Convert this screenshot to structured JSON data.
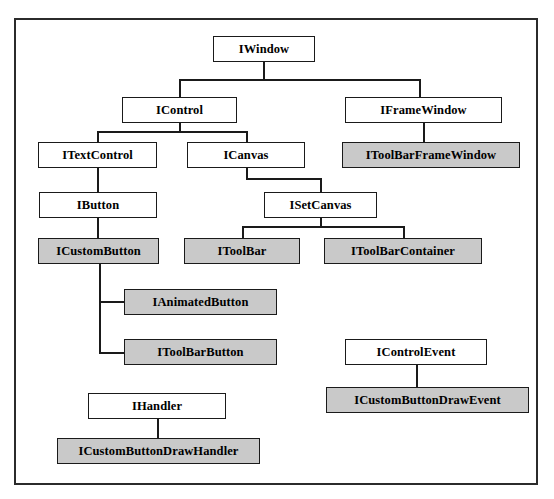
{
  "diagram": {
    "type": "class-hierarchy-tree",
    "background_color": "#ffffff",
    "frame_border_color": "#2b2b2b",
    "node_border_color": "#1a1a1a",
    "node_fill_plain": "#ffffff",
    "node_fill_shaded": "#c9c9c9",
    "nodes": [
      {
        "id": "iwindow",
        "label": "IWindow",
        "shaded": false,
        "x": 211,
        "y": 34,
        "w": 102,
        "h": 26
      },
      {
        "id": "icontrol",
        "label": "IControl",
        "shaded": false,
        "x": 120,
        "y": 95,
        "w": 115,
        "h": 26
      },
      {
        "id": "iframewindow",
        "label": "IFrameWindow",
        "shaded": false,
        "x": 343,
        "y": 95,
        "w": 157,
        "h": 26
      },
      {
        "id": "itextcontrol",
        "label": "ITextControl",
        "shaded": false,
        "x": 36,
        "y": 140,
        "w": 119,
        "h": 26
      },
      {
        "id": "icanvas",
        "label": "ICanvas",
        "shaded": false,
        "x": 185,
        "y": 140,
        "w": 118,
        "h": 26
      },
      {
        "id": "itoolbarframewindow",
        "label": "IToolBarFrameWindow",
        "shaded": true,
        "x": 340,
        "y": 140,
        "w": 178,
        "h": 26
      },
      {
        "id": "ibutton",
        "label": "IButton",
        "shaded": false,
        "x": 37,
        "y": 190,
        "w": 118,
        "h": 26
      },
      {
        "id": "isetcanvas",
        "label": "ISetCanvas",
        "shaded": false,
        "x": 262,
        "y": 190,
        "w": 113,
        "h": 26
      },
      {
        "id": "icustombutton",
        "label": "ICustomButton",
        "shaded": true,
        "x": 36,
        "y": 236,
        "w": 121,
        "h": 26
      },
      {
        "id": "itoolbar",
        "label": "IToolBar",
        "shaded": true,
        "x": 182,
        "y": 236,
        "w": 116,
        "h": 26
      },
      {
        "id": "itoolbarcontainer",
        "label": "IToolBarContainer",
        "shaded": true,
        "x": 322,
        "y": 236,
        "w": 158,
        "h": 26
      },
      {
        "id": "ianimatedbutton",
        "label": "IAnimatedButton",
        "shaded": true,
        "x": 122,
        "y": 287,
        "w": 153,
        "h": 26
      },
      {
        "id": "itoolbarbutton",
        "label": "IToolBarButton",
        "shaded": true,
        "x": 122,
        "y": 337,
        "w": 153,
        "h": 26
      },
      {
        "id": "icontrolevent",
        "label": "IControlEvent",
        "shaded": false,
        "x": 343,
        "y": 337,
        "w": 142,
        "h": 26
      },
      {
        "id": "icustombuttondrawevent",
        "label": "ICustomButtonDrawEvent",
        "shaded": true,
        "x": 324,
        "y": 385,
        "w": 203,
        "h": 26
      },
      {
        "id": "ihandler",
        "label": "IHandler",
        "shaded": false,
        "x": 86,
        "y": 391,
        "w": 138,
        "h": 26
      },
      {
        "id": "icustombuttondrawhandler",
        "label": "ICustomButtonDrawHandler",
        "shaded": true,
        "x": 55,
        "y": 436,
        "w": 203,
        "h": 26
      }
    ],
    "edges": [
      {
        "id": "iwindow-stem",
        "from": "iwindow",
        "orient": "v",
        "x": 261,
        "y": 60,
        "len": 17
      },
      {
        "id": "iwindow-bus",
        "from": "iwindow",
        "orient": "h",
        "x": 177,
        "y": 77,
        "len": 240
      },
      {
        "id": "icontrol-drop",
        "to": "icontrol",
        "orient": "v",
        "x": 177,
        "y": 77,
        "len": 18
      },
      {
        "id": "iframewindow-drop",
        "to": "iframewindow",
        "orient": "v",
        "x": 417,
        "y": 77,
        "len": 18
      },
      {
        "id": "icontrol-stem",
        "from": "icontrol",
        "orient": "v",
        "x": 177,
        "y": 121,
        "len": 8
      },
      {
        "id": "icontrol-bus",
        "from": "icontrol",
        "orient": "h",
        "x": 95,
        "y": 129,
        "len": 149
      },
      {
        "id": "itextcontrol-drop",
        "to": "itextcontrol",
        "orient": "v",
        "x": 95,
        "y": 129,
        "len": 11
      },
      {
        "id": "icanvas-drop",
        "to": "icanvas",
        "orient": "v",
        "x": 244,
        "y": 129,
        "len": 11
      },
      {
        "id": "iframewindow-stem",
        "from": "iframewindow",
        "orient": "v",
        "x": 421,
        "y": 121,
        "len": 19
      },
      {
        "id": "itextcontrol-stem",
        "from": "itextcontrol",
        "orient": "v",
        "x": 95,
        "y": 166,
        "len": 24
      },
      {
        "id": "icanvas-stem",
        "from": "icanvas",
        "orient": "v",
        "x": 244,
        "y": 166,
        "len": 10
      },
      {
        "id": "icanvas-jog",
        "from": "icanvas",
        "orient": "h",
        "x": 244,
        "y": 176,
        "len": 75
      },
      {
        "id": "isetcanvas-drop",
        "to": "isetcanvas",
        "orient": "v",
        "x": 318,
        "y": 176,
        "len": 14
      },
      {
        "id": "ibutton-stem",
        "from": "ibutton",
        "orient": "v",
        "x": 95,
        "y": 216,
        "len": 20
      },
      {
        "id": "isetcanvas-stem",
        "from": "isetcanvas",
        "orient": "v",
        "x": 318,
        "y": 216,
        "len": 8
      },
      {
        "id": "isetcanvas-bus",
        "from": "isetcanvas",
        "orient": "h",
        "x": 240,
        "y": 224,
        "len": 161
      },
      {
        "id": "itoolbar-drop",
        "to": "itoolbar",
        "orient": "v",
        "x": 240,
        "y": 224,
        "len": 12
      },
      {
        "id": "itoolbarcont-drop",
        "to": "itoolbarcontainer",
        "orient": "v",
        "x": 401,
        "y": 224,
        "len": 12
      },
      {
        "id": "icustombutton-spine",
        "from": "icustombutton",
        "orient": "v",
        "x": 97,
        "y": 262,
        "len": 88
      },
      {
        "id": "ianimated-stub",
        "to": "ianimatedbutton",
        "orient": "h",
        "x": 97,
        "y": 299,
        "len": 25
      },
      {
        "id": "itoolbarbutton-stub",
        "to": "itoolbarbutton",
        "orient": "h",
        "x": 97,
        "y": 350,
        "len": 25
      },
      {
        "id": "icontrolevent-stem",
        "from": "icontrolevent",
        "orient": "v",
        "x": 414,
        "y": 363,
        "len": 22
      },
      {
        "id": "ihandler-stem",
        "from": "ihandler",
        "orient": "v",
        "x": 155,
        "y": 417,
        "len": 19
      }
    ]
  }
}
